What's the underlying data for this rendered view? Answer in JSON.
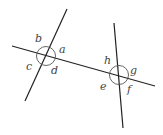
{
  "diagram": {
    "colors": {
      "line": "#222222",
      "circle": "#555555",
      "label": "#444444"
    },
    "labels": {
      "a": "a",
      "b": "b",
      "c": "c",
      "d": "d",
      "e": "e",
      "f": "f",
      "g": "g",
      "h": "h"
    },
    "intersections": [
      {
        "name": "left",
        "angles": [
          "a",
          "b",
          "c",
          "d"
        ]
      },
      {
        "name": "right",
        "angles": [
          "e",
          "f",
          "g",
          "h"
        ]
      }
    ]
  }
}
